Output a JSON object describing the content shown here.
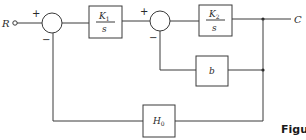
{
  "diagram": {
    "type": "control-system-block-diagram",
    "input": {
      "label": "R"
    },
    "output": {
      "label": "C"
    },
    "summing_junctions": [
      {
        "id": "sum1",
        "signs": {
          "left": "+",
          "bottom": "−"
        }
      },
      {
        "id": "sum2",
        "signs": {
          "left": "+",
          "bottom": "−"
        }
      }
    ],
    "blocks": [
      {
        "id": "k1",
        "numerator": "K",
        "numerator_sub": "1",
        "denominator": "s"
      },
      {
        "id": "k2",
        "numerator": "K",
        "numerator_sub": "2",
        "denominator": "s"
      },
      {
        "id": "b",
        "label": "b"
      },
      {
        "id": "h0",
        "label": "H",
        "label_sub": "0"
      }
    ],
    "connections": [
      "R -> sum1(+)",
      "sum1 -> K1/s",
      "K1/s -> sum2(+)",
      "sum2 -> K2/s",
      "K2/s -> C",
      "C -> b -> sum2(−)",
      "C -> H0 -> sum1(−)"
    ],
    "caption_fragment": "Figu"
  }
}
